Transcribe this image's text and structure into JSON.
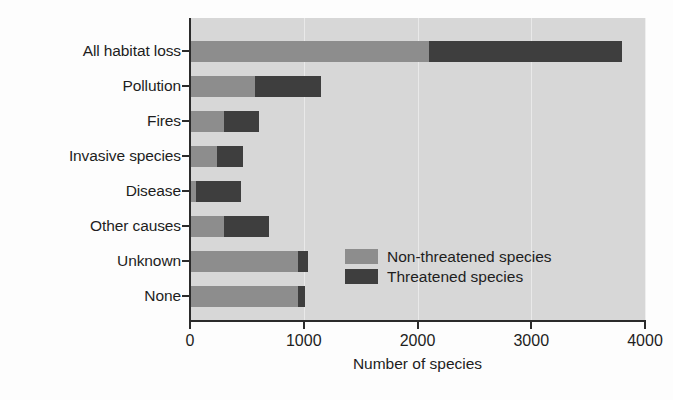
{
  "chart_data": {
    "type": "bar",
    "orientation": "horizontal",
    "stacked": true,
    "title": "",
    "xlabel": "Number of species",
    "ylabel": "",
    "xlim": [
      0,
      4000
    ],
    "xticks": [
      0,
      1000,
      2000,
      3000,
      4000
    ],
    "xtick_labels": [
      "0",
      "1000",
      "2000",
      "3000",
      "4000"
    ],
    "grid": "vertical-light",
    "legend_position": "inside-right-lower",
    "categories": [
      "All habitat loss",
      "Pollution",
      "Fires",
      "Invasive species",
      "Disease",
      "Other causes",
      "Unknown",
      "None"
    ],
    "series": [
      {
        "name": "Non-threatened species",
        "color": "#8d8d8d",
        "values": [
          2100,
          570,
          300,
          240,
          55,
          300,
          950,
          950
        ]
      },
      {
        "name": "Threatened species",
        "color": "#3e3e3e",
        "values": [
          1700,
          580,
          305,
          230,
          395,
          395,
          90,
          60
        ]
      }
    ],
    "totals": [
      3800,
      1150,
      605,
      470,
      450,
      695,
      1040,
      1010
    ]
  },
  "legend": {
    "entries": [
      {
        "label": "Non-threatened species",
        "color": "#8d8d8d"
      },
      {
        "label": "Threatened species",
        "color": "#3e3e3e"
      }
    ]
  },
  "axes": {
    "x_title": "Number of species",
    "tick_labels": [
      "0",
      "1000",
      "2000",
      "3000",
      "4000"
    ]
  },
  "colors": {
    "plot_background": "#d7d7d7",
    "page_background": "#fdfdfd",
    "axis": "#2b2b2b",
    "gridline": "#ececec",
    "non_threatened": "#8d8d8d",
    "threatened": "#3e3e3e"
  }
}
